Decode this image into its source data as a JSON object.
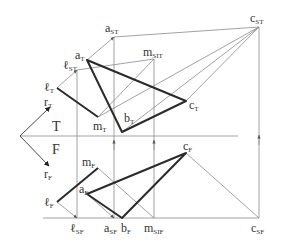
{
  "diagram": {
    "colors": {
      "thin": "#8a8a8a",
      "thick": "#2b2b2b",
      "text": "#333333"
    },
    "planes": {
      "top": "T",
      "front": "F"
    },
    "labels": {
      "aST": {
        "base": "a",
        "sub": "ST"
      },
      "cST": {
        "base": "c",
        "sub": "ST"
      },
      "aT": {
        "base": "a",
        "sub": "T"
      },
      "mSIT": {
        "base": "m",
        "sub": "SIT"
      },
      "lST": {
        "base": "ℓ",
        "sub": "ST"
      },
      "lT": {
        "base": "ℓ",
        "sub": "T"
      },
      "rT": {
        "base": "r",
        "sub": "T"
      },
      "cT": {
        "base": "c",
        "sub": "T"
      },
      "bT": {
        "base": "b",
        "sub": "T"
      },
      "mT": {
        "base": "m",
        "sub": "T"
      },
      "rF": {
        "base": "r",
        "sub": "F"
      },
      "mF": {
        "base": "m",
        "sub": "F"
      },
      "cF": {
        "base": "c",
        "sub": "F"
      },
      "aF": {
        "base": "a",
        "sub": "F"
      },
      "lF": {
        "base": "ℓ",
        "sub": "F"
      },
      "lSF": {
        "base": "ℓ",
        "sub": "SF"
      },
      "aSF": {
        "base": "a",
        "sub": "SF"
      },
      "bF": {
        "base": "b",
        "sub": "F"
      },
      "mSIF": {
        "base": "m",
        "sub": "SIF"
      },
      "cSF": {
        "base": "c",
        "sub": "SF"
      }
    }
  }
}
